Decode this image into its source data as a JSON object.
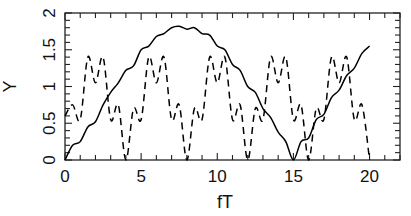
{
  "chart_data": {
    "type": "line",
    "title": "",
    "xlabel": "fT",
    "ylabel": "Y",
    "xlim": [
      0,
      22
    ],
    "ylim": [
      0,
      2
    ],
    "grid": false,
    "legend": null,
    "x_ticks": [
      0,
      5,
      10,
      15,
      20
    ],
    "x_tick_labels": [
      "0",
      "5",
      "10",
      "15",
      "20"
    ],
    "y_ticks": [
      0,
      0.5,
      1,
      1.5,
      2
    ],
    "y_tick_labels": [
      "0",
      "0.5",
      "1",
      "1.5",
      "2"
    ],
    "x": [
      0,
      0.5,
      1,
      1.5,
      2,
      2.5,
      3,
      3.5,
      4,
      4.5,
      5,
      5.5,
      6,
      6.5,
      7,
      7.5,
      8,
      8.5,
      9,
      9.5,
      10,
      10.5,
      11,
      11.5,
      12,
      12.5,
      13,
      13.5,
      14,
      14.5,
      15,
      15.5,
      16,
      16.5,
      17,
      17.5,
      18,
      18.5,
      19,
      19.5,
      20
    ],
    "series": [
      {
        "name": "solid",
        "style": "solid",
        "color": "#000000",
        "values": [
          0.0,
          0.2,
          0.25,
          0.45,
          0.52,
          0.75,
          0.92,
          1.05,
          1.22,
          1.28,
          1.5,
          1.55,
          1.68,
          1.72,
          1.8,
          1.82,
          1.78,
          1.8,
          1.72,
          1.7,
          1.55,
          1.5,
          1.3,
          1.22,
          1.0,
          0.92,
          0.7,
          0.58,
          0.38,
          0.25,
          0.0,
          0.25,
          0.3,
          0.55,
          0.62,
          0.85,
          0.95,
          1.15,
          1.25,
          1.45,
          1.55
        ]
      },
      {
        "name": "dashed",
        "style": "dashed",
        "color": "#000000",
        "values": [
          0.6,
          0.75,
          0.55,
          1.4,
          1.05,
          1.4,
          0.55,
          0.75,
          0.0,
          0.7,
          0.55,
          1.4,
          1.05,
          1.4,
          0.55,
          0.75,
          0.0,
          0.7,
          0.55,
          1.4,
          1.05,
          1.4,
          0.55,
          0.75,
          0.0,
          0.7,
          0.55,
          1.4,
          1.05,
          1.4,
          0.55,
          0.75,
          0.0,
          0.7,
          0.55,
          1.4,
          1.05,
          1.4,
          0.55,
          0.75,
          0.0
        ]
      }
    ]
  },
  "layout": {
    "plot_left": 65,
    "plot_right": 400,
    "plot_top": 13,
    "plot_bottom": 160
  }
}
